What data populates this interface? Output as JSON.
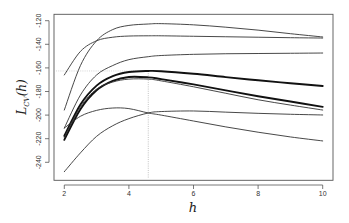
{
  "chart_data": {
    "type": "line",
    "title": "",
    "xlabel": "h",
    "ylabel": "L_CV(h)",
    "ylabel_main": "L",
    "ylabel_sub": "CV",
    "ylabel_arg": "(h)",
    "xlim": [
      2,
      10
    ],
    "ylim": [
      -254,
      -116
    ],
    "x_ticks": [
      2,
      4,
      6,
      8,
      10
    ],
    "y_ticks": [
      -120,
      -140,
      -160,
      -180,
      -200,
      -220,
      -240
    ],
    "grid": false,
    "legend": null,
    "annotations": {
      "vertical_reference_line": {
        "x": 4.6,
        "style": "dotted"
      },
      "horizontal_reference_line": {
        "y": -162.6,
        "x_from": 2,
        "x_to": 4.6,
        "style": "dotted"
      }
    },
    "x": [
      2,
      2.5,
      3,
      3.5,
      4,
      4.6,
      5,
      6,
      7,
      8,
      9,
      10
    ],
    "series": [
      {
        "name": "curve-1",
        "weight": "thin",
        "values": [
          -195.7,
          -158,
          -137,
          -127.5,
          -124,
          -122.8,
          -122.5,
          -123.5,
          -125.5,
          -128,
          -131,
          -133.8
        ]
      },
      {
        "name": "curve-2",
        "weight": "thin",
        "values": [
          -166,
          -146,
          -137,
          -134,
          -133,
          -132.8,
          -132.8,
          -133.2,
          -133.6,
          -134,
          -134.4,
          -134.7
        ]
      },
      {
        "name": "curve-3",
        "weight": "thin",
        "values": [
          -211,
          -183,
          -166,
          -158,
          -153,
          -150.5,
          -149.5,
          -148.5,
          -148,
          -147.8,
          -147.6,
          -147.4
        ]
      },
      {
        "name": "curve-4",
        "weight": "thick",
        "values": [
          -217.7,
          -191,
          -175,
          -167,
          -163.5,
          -162.6,
          -162.8,
          -165,
          -167.8,
          -170.5,
          -173,
          -175.3
        ]
      },
      {
        "name": "curve-5",
        "weight": "thick",
        "values": [
          -221,
          -195,
          -179,
          -171,
          -167.7,
          -168,
          -169.5,
          -174,
          -179,
          -184,
          -188.5,
          -193
        ]
      },
      {
        "name": "curve-6",
        "weight": "thin",
        "values": [
          -219,
          -193,
          -178,
          -172,
          -169.5,
          -169.5,
          -171,
          -176,
          -181.5,
          -187,
          -191.5,
          -195.7
        ]
      },
      {
        "name": "curve-7",
        "weight": "thin",
        "values": [
          -211,
          -201,
          -196,
          -194,
          -194.5,
          -198.2,
          -200,
          -205,
          -210,
          -214.5,
          -218.5,
          -221.9
        ]
      },
      {
        "name": "curve-8",
        "weight": "thin",
        "values": [
          -248,
          -232,
          -218,
          -209,
          -203,
          -198.2,
          -197,
          -196.5,
          -197.5,
          -198.5,
          -199.3,
          -199.9
        ]
      }
    ]
  }
}
